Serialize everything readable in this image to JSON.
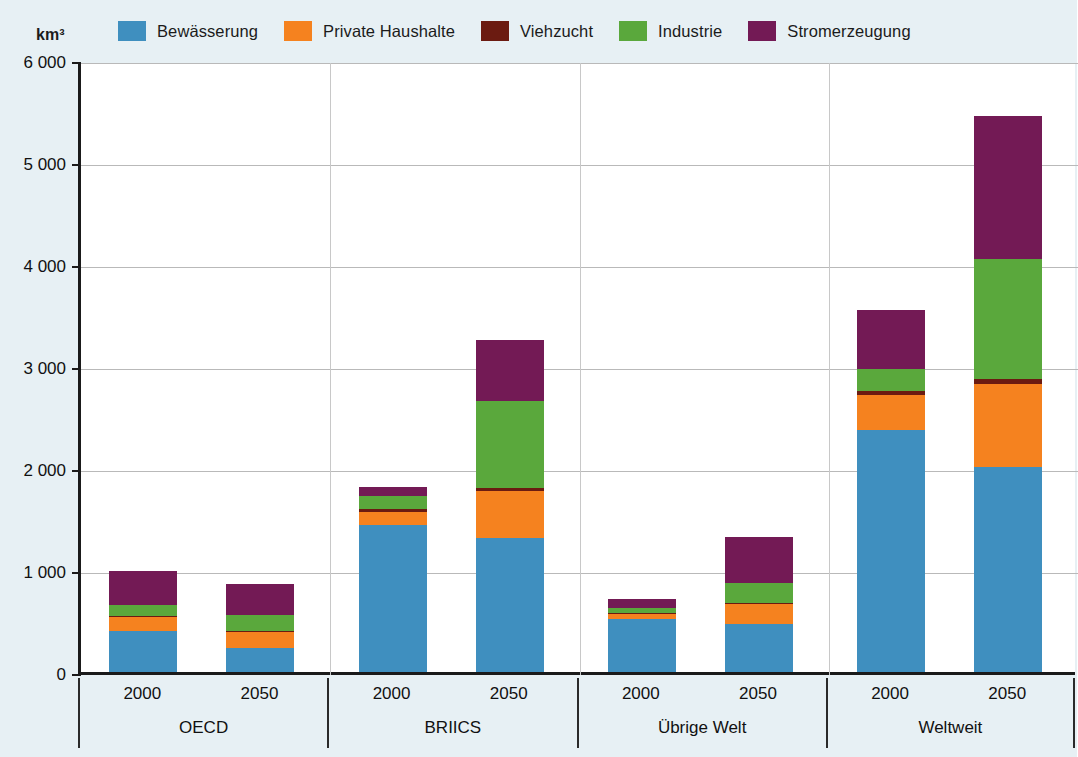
{
  "chart_data": {
    "type": "bar",
    "subtype": "stacked-grouped",
    "title": "",
    "xlabel": "",
    "ylabel": "km³",
    "unit": "km³",
    "ylim": [
      0,
      6000
    ],
    "yticks": [
      0,
      1000,
      2000,
      3000,
      4000,
      5000,
      6000
    ],
    "ytick_labels": [
      "0",
      "1 000",
      "2 000",
      "3 000",
      "4 000",
      "5 000",
      "6 000"
    ],
    "grid": true,
    "legend_position": "top",
    "series": [
      {
        "name": "Bewässerung",
        "color": "#3f8fbf",
        "values": [
          400,
          240,
          1440,
          1310,
          520,
          470,
          2370,
          2010
        ]
      },
      {
        "name": "Private Haushalte",
        "color": "#f5821f",
        "values": [
          140,
          155,
          130,
          460,
          45,
          195,
          350,
          810
        ]
      },
      {
        "name": "Viehzucht",
        "color": "#6b1b11",
        "values": [
          10,
          10,
          25,
          30,
          10,
          10,
          40,
          50
        ]
      },
      {
        "name": "Industrie",
        "color": "#5aa83c",
        "values": [
          110,
          155,
          130,
          860,
          55,
          200,
          210,
          1180
        ]
      },
      {
        "name": "Stromerzeugung",
        "color": "#731a55",
        "values": [
          330,
          305,
          90,
          600,
          90,
          450,
          580,
          1400
        ]
      }
    ],
    "categories": [
      {
        "group": "OECD",
        "year": "2000",
        "total": 990
      },
      {
        "group": "OECD",
        "year": "2050",
        "total": 865
      },
      {
        "group": "BRIICS",
        "year": "2000",
        "total": 1815
      },
      {
        "group": "BRIICS",
        "year": "2050",
        "total": 3260
      },
      {
        "group": "Übrige Welt",
        "year": "2000",
        "total": 720
      },
      {
        "group": "Übrige Welt",
        "year": "2050",
        "total": 1325
      },
      {
        "group": "Weltweit",
        "year": "2000",
        "total": 3550
      },
      {
        "group": "Weltweit",
        "year": "2050",
        "total": 5450
      }
    ],
    "groups": [
      "OECD",
      "BRIICS",
      "Übrige Welt",
      "Weltweit"
    ],
    "years": [
      "2000",
      "2050"
    ]
  },
  "legend": {
    "items": [
      {
        "label": "Bewässerung",
        "color": "#3f8fbf"
      },
      {
        "label": "Private Haushalte",
        "color": "#f5821f"
      },
      {
        "label": "Viehzucht",
        "color": "#6b1b11"
      },
      {
        "label": "Industrie",
        "color": "#5aa83c"
      },
      {
        "label": "Stromerzeugung",
        "color": "#731a55"
      }
    ]
  },
  "axis": {
    "unit_label": "km³",
    "y_labels": [
      "6 000",
      "5 000",
      "4 000",
      "3 000",
      "2 000",
      "1 000",
      "0"
    ]
  },
  "groups": [
    {
      "label": "OECD",
      "years": [
        "2000",
        "2050"
      ]
    },
    {
      "label": "BRIICS",
      "years": [
        "2000",
        "2050"
      ]
    },
    {
      "label": "Übrige Welt",
      "years": [
        "2000",
        "2050"
      ]
    },
    {
      "label": "Weltweit",
      "years": [
        "2000",
        "2050"
      ]
    }
  ],
  "colors": {
    "background": "#e7f0f4",
    "plot_background": "#ffffff",
    "axis": "#1a1a1a",
    "grid": "#b9b9b9"
  }
}
